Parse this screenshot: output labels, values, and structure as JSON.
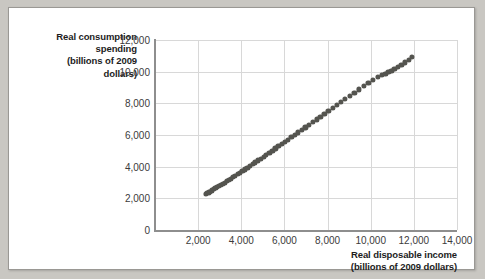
{
  "chart_data": {
    "type": "scatter",
    "title": "",
    "xlabel": "Real disposable income (billions of 2009 dollars)",
    "ylabel": "Real consumption spending (billions of 2009 dollars)",
    "xlabel_lines": [
      "Real disposable income",
      "(billions of 2009 dollars)"
    ],
    "ylabel_lines": [
      "Real consumption",
      "spending",
      "(billions of 2009",
      "dollars)"
    ],
    "xlim": [
      0,
      14000
    ],
    "ylim": [
      0,
      12000
    ],
    "xticks": [
      2000,
      4000,
      6000,
      8000,
      10000,
      12000,
      14000
    ],
    "yticks": [
      0,
      2000,
      4000,
      6000,
      8000,
      10000,
      12000
    ],
    "xtick_labels": [
      "2,000",
      "4,000",
      "6,000",
      "8,000",
      "10,000",
      "12,000",
      "14,000"
    ],
    "ytick_labels": [
      "0",
      "2,000",
      "4,000",
      "6,000",
      "8,000",
      "10,000",
      "12,000"
    ],
    "grid": true,
    "legend": "none",
    "marker_color": "#54544f",
    "grid_color": "#d8d8d8",
    "axis_color": "#8e8e8e",
    "points": [
      [
        2350,
        2260
      ],
      [
        2420,
        2320
      ],
      [
        2490,
        2380
      ],
      [
        2560,
        2430
      ],
      [
        2640,
        2500
      ],
      [
        2720,
        2570
      ],
      [
        2800,
        2640
      ],
      [
        2880,
        2700
      ],
      [
        2960,
        2770
      ],
      [
        3050,
        2850
      ],
      [
        3140,
        2930
      ],
      [
        3230,
        3000
      ],
      [
        3320,
        3080
      ],
      [
        3420,
        3160
      ],
      [
        3520,
        3250
      ],
      [
        3620,
        3340
      ],
      [
        3720,
        3430
      ],
      [
        3830,
        3530
      ],
      [
        3940,
        3630
      ],
      [
        4050,
        3730
      ],
      [
        4160,
        3830
      ],
      [
        4280,
        3940
      ],
      [
        4400,
        4050
      ],
      [
        4520,
        4160
      ],
      [
        4640,
        4270
      ],
      [
        4770,
        4390
      ],
      [
        4900,
        4510
      ],
      [
        5030,
        4630
      ],
      [
        5160,
        4760
      ],
      [
        5300,
        4890
      ],
      [
        5440,
        5020
      ],
      [
        5580,
        5150
      ],
      [
        5720,
        5290
      ],
      [
        5870,
        5430
      ],
      [
        6020,
        5570
      ],
      [
        6170,
        5710
      ],
      [
        6320,
        5860
      ],
      [
        6480,
        6010
      ],
      [
        6640,
        6160
      ],
      [
        6800,
        6320
      ],
      [
        6970,
        6480
      ],
      [
        7140,
        6640
      ],
      [
        7310,
        6810
      ],
      [
        7490,
        6980
      ],
      [
        7670,
        7150
      ],
      [
        7850,
        7330
      ],
      [
        8040,
        7510
      ],
      [
        8230,
        7690
      ],
      [
        8420,
        7880
      ],
      [
        8620,
        8070
      ],
      [
        8820,
        8270
      ],
      [
        9030,
        8470
      ],
      [
        9240,
        8670
      ],
      [
        9450,
        8880
      ],
      [
        9670,
        9090
      ],
      [
        9890,
        9300
      ],
      [
        10110,
        9500
      ],
      [
        10330,
        9680
      ],
      [
        10520,
        9800
      ],
      [
        10680,
        9880
      ],
      [
        10820,
        9960
      ],
      [
        10960,
        10050
      ],
      [
        11100,
        10160
      ],
      [
        11250,
        10280
      ],
      [
        11420,
        10420
      ],
      [
        11600,
        10580
      ],
      [
        11780,
        10760
      ],
      [
        11900,
        10950
      ]
    ]
  }
}
